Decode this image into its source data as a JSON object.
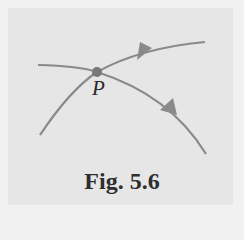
{
  "figure": {
    "caption": "Fig. 5.6",
    "point_label": "P",
    "colors": {
      "background": "#e6e6e6",
      "surround": "#f1f1f1",
      "curve": "#8a8a8a",
      "point": "#777777",
      "text": "#2e2e2e"
    },
    "curves": [
      {
        "name": "curve-upper",
        "description": "line passing through P rising to the upper right, arrow pointing right"
      },
      {
        "name": "curve-lower",
        "description": "line passing through P curving down to the lower right, arrow pointing down-right"
      }
    ]
  }
}
